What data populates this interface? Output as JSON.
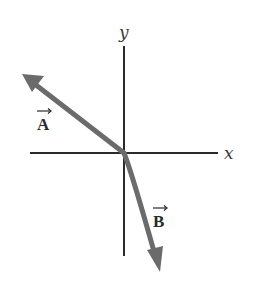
{
  "diagram": {
    "type": "vector-diagram",
    "axes": {
      "x_label": "x",
      "y_label": "y",
      "origin": [
        124,
        153
      ]
    },
    "vectors": [
      {
        "name": "A",
        "label": "A",
        "tail": [
          124,
          153
        ],
        "tip": [
          22,
          74
        ],
        "direction": "up-left",
        "color": "#6b6b6b"
      },
      {
        "name": "B",
        "label": "B",
        "tail": [
          124,
          153
        ],
        "tip": [
          160,
          272
        ],
        "direction": "down-right",
        "color": "#6b6b6b"
      }
    ],
    "axis_color": "#2b2b2b"
  }
}
